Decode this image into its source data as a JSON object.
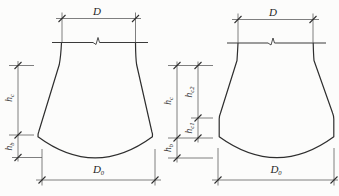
{
  "figures": {
    "left": {
      "top_diameter_label": "D",
      "bottom_diameter_label": {
        "base": "D",
        "sub": "0"
      },
      "height_labels": {
        "hc": {
          "base": "h",
          "sub": "c"
        },
        "hb": {
          "base": "h",
          "sub": "b"
        }
      }
    },
    "right": {
      "top_diameter_label": "D",
      "bottom_diameter_label": {
        "base": "D",
        "sub": "0"
      },
      "height_labels": {
        "hc": {
          "base": "h",
          "sub": "c"
        },
        "hc1": {
          "base": "h",
          "sub": "c1"
        },
        "hc2": {
          "base": "h",
          "sub": "c2"
        },
        "hb": {
          "base": "h",
          "sub": "b"
        }
      }
    }
  },
  "colors": {
    "background": "#fcfcfb",
    "outline": "#2e2e2e",
    "dimension_line": "#565656",
    "text": "#1f1f1f"
  }
}
